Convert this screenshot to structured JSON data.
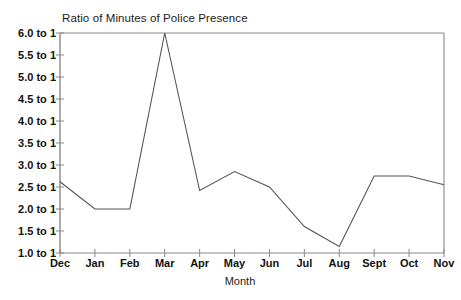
{
  "chart_data": {
    "type": "line",
    "title": "Ratio of Minutes of Police Presence",
    "xlabel": "Month",
    "ylabel": "",
    "categories": [
      "Dec",
      "Jan",
      "Feb",
      "Mar",
      "Apr",
      "May",
      "Jun",
      "Jul",
      "Aug",
      "Sept",
      "Oct",
      "Nov"
    ],
    "values": [
      2.62,
      2.0,
      2.0,
      6.0,
      2.42,
      2.85,
      2.5,
      1.6,
      1.15,
      2.75,
      2.75,
      2.55
    ],
    "ylim": [
      1.0,
      6.0
    ],
    "ytick_values": [
      1.0,
      1.5,
      2.0,
      2.5,
      3.0,
      3.5,
      4.0,
      4.5,
      5.0,
      5.5,
      6.0
    ],
    "ytick_labels": [
      "1.0 to 1",
      "1.5 to 1",
      "2.0 to 1",
      "2.5 to 1",
      "3.0 to 1",
      "3.5 to 1",
      "4.0 to 1",
      "4.5 to 1",
      "5.0 to 1",
      "5.5 to 1",
      "6.0 to 1"
    ],
    "grid": false,
    "legend": null,
    "line_color": "#555555",
    "axis_color": "#888888",
    "background_color": "#ffffff"
  }
}
